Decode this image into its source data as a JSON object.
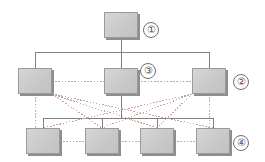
{
  "diagram": {
    "canvas": {
      "width": 265,
      "height": 162
    },
    "colors": {
      "node_fill": "#cfcfcf",
      "node_border": "#9a9a9a",
      "node_shadow": "#8e8e8e",
      "solid_link": "#808080",
      "dotted_link": "#c8a6a0",
      "label_text": "#4a4a4a",
      "background": "#ffffff"
    },
    "tier_labels": [
      {
        "name": "tier-1-label",
        "text": "①",
        "x": 143,
        "y": 22
      },
      {
        "name": "tier-2-label",
        "text": "②",
        "x": 233,
        "y": 74
      },
      {
        "name": "tier-3-label",
        "text": "③",
        "x": 140,
        "y": 63
      },
      {
        "name": "tier-4-label",
        "text": "④",
        "x": 233,
        "y": 135
      }
    ],
    "nodes": [
      {
        "name": "node-tier1-root",
        "tier": 1,
        "x": 104,
        "y": 12,
        "w": 34,
        "h": 26
      },
      {
        "name": "node-tier2-left",
        "tier": 2,
        "x": 18,
        "y": 68,
        "w": 34,
        "h": 26
      },
      {
        "name": "node-tier2-center",
        "tier": 2,
        "x": 104,
        "y": 68,
        "w": 34,
        "h": 26
      },
      {
        "name": "node-tier2-right",
        "tier": 2,
        "x": 192,
        "y": 68,
        "w": 34,
        "h": 26
      },
      {
        "name": "node-tier4-1",
        "tier": 4,
        "x": 26,
        "y": 128,
        "w": 34,
        "h": 26
      },
      {
        "name": "node-tier4-2",
        "tier": 4,
        "x": 85,
        "y": 128,
        "w": 34,
        "h": 26
      },
      {
        "name": "node-tier4-3",
        "tier": 4,
        "x": 140,
        "y": 128,
        "w": 34,
        "h": 26
      },
      {
        "name": "node-tier4-4",
        "tier": 4,
        "x": 196,
        "y": 128,
        "w": 34,
        "h": 26
      }
    ],
    "solid_links": [
      {
        "name": "link-root-stem",
        "points": "121,38 121,52"
      },
      {
        "name": "link-tier2-bus",
        "points": "35,52 209,52"
      },
      {
        "name": "link-bus-drop-left",
        "points": "35,52 35,68"
      },
      {
        "name": "link-bus-drop-center",
        "points": "121,52 121,68"
      },
      {
        "name": "link-bus-drop-right",
        "points": "209,52 209,68"
      },
      {
        "name": "link-center-stem",
        "points": "121,94 121,118"
      },
      {
        "name": "link-tier4-bus",
        "points": "43,118 213,118"
      },
      {
        "name": "link-bus-drop-n1",
        "points": "43,118 43,128"
      },
      {
        "name": "link-bus-drop-n2",
        "points": "102,118 102,128"
      },
      {
        "name": "link-bus-drop-n3",
        "points": "157,118 157,128"
      },
      {
        "name": "link-bus-drop-n4",
        "points": "213,118 213,128"
      }
    ],
    "dotted_links": [
      {
        "name": "dotted-tier2-row-left",
        "points": "52,81 104,81"
      },
      {
        "name": "dotted-tier2-row-right",
        "points": "138,81 192,81"
      },
      {
        "name": "dotted-tier4-row-1",
        "points": "60,141 85,141"
      },
      {
        "name": "dotted-tier4-row-2",
        "points": "119,141 140,141"
      },
      {
        "name": "dotted-tier4-row-3",
        "points": "174,141 196,141"
      },
      {
        "name": "dotted-vert-left",
        "points": "35,94 35,128"
      },
      {
        "name": "dotted-vert-right",
        "points": "209,94 209,128"
      },
      {
        "name": "mesh-l-to-n2",
        "points": "52,94 102,128"
      },
      {
        "name": "mesh-l-to-n3",
        "points": "52,94 157,128"
      },
      {
        "name": "mesh-l-to-n4",
        "points": "52,94 213,128"
      },
      {
        "name": "mesh-r-to-n1",
        "points": "192,94 43,128"
      },
      {
        "name": "mesh-r-to-n2",
        "points": "192,94 102,128"
      },
      {
        "name": "mesh-r-to-n3",
        "points": "192,94 157,128"
      }
    ]
  }
}
